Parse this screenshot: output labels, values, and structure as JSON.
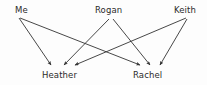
{
  "diagram": {
    "title": "",
    "background_color": "#fdfdfd",
    "line_color": "#333333",
    "text_color": "#2b2b2b",
    "nodes": [
      {
        "id": "me",
        "label": "Me",
        "role": "source",
        "x": 15,
        "y": 5,
        "anchor_x": 17,
        "anchor_y": 17
      },
      {
        "id": "rogan",
        "label": "Rogan",
        "role": "source",
        "x": 95,
        "y": 5,
        "anchor_x": 111,
        "anchor_y": 17
      },
      {
        "id": "keith",
        "label": "Keith",
        "role": "source",
        "x": 174,
        "y": 5,
        "anchor_x": 188,
        "anchor_y": 17
      },
      {
        "id": "heather",
        "label": "Heather",
        "role": "target",
        "x": 42,
        "y": 70,
        "anchor_x": 60,
        "anchor_y": 67
      },
      {
        "id": "rachel",
        "label": "Rachel",
        "role": "target",
        "x": 133,
        "y": 70,
        "anchor_x": 148,
        "anchor_y": 67
      }
    ],
    "edges": [
      {
        "id": "me-heather",
        "from": "me",
        "to": "heather",
        "x1": 19,
        "y1": 18,
        "x2": 51,
        "y2": 65
      },
      {
        "id": "me-rachel",
        "from": "me",
        "to": "rachel",
        "x1": 20,
        "y1": 18,
        "x2": 140,
        "y2": 65
      },
      {
        "id": "rogan-heather",
        "from": "rogan",
        "to": "heather",
        "x1": 109,
        "y1": 19,
        "x2": 64,
        "y2": 65
      },
      {
        "id": "rogan-rachel",
        "from": "rogan",
        "to": "rachel",
        "x1": 113,
        "y1": 19,
        "x2": 150,
        "y2": 65
      },
      {
        "id": "keith-heather",
        "from": "keith",
        "to": "heather",
        "x1": 186,
        "y1": 18,
        "x2": 75,
        "y2": 65
      },
      {
        "id": "keith-rachel",
        "from": "keith",
        "to": "rachel",
        "x1": 187,
        "y1": 19,
        "x2": 160,
        "y2": 65
      }
    ]
  }
}
